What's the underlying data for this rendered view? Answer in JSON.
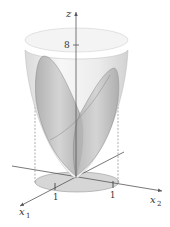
{
  "figure": {
    "type": "3d-surface-diagram",
    "axes": {
      "z": {
        "label": "z",
        "tick_label": "8"
      },
      "x1": {
        "label": "x",
        "subscript": "1",
        "tick_label": "1"
      },
      "x2": {
        "label": "x",
        "subscript": "2",
        "tick_label": "1"
      }
    },
    "surfaces": [
      {
        "name": "outer-paraboloid",
        "color": "#ededed"
      },
      {
        "name": "inner-saddle-surface",
        "color": "#bdbdbd"
      }
    ],
    "base_region": {
      "shape": "disk",
      "color": "#d4d4d4"
    },
    "colors": {
      "axis": "#555555",
      "surface_light": "#efefef",
      "surface_dark": "#b8b8b8",
      "base": "#d6d6d6",
      "text": "#333333"
    }
  }
}
